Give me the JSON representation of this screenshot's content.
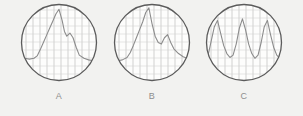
{
  "figure": {
    "background_color": "#f2f2f0",
    "panel_count": 3,
    "panels": [
      {
        "id": "A",
        "caption": "A",
        "shape": "circle",
        "border_color": "#5b5b5b",
        "grid_color": "#b9b9b9",
        "trace_color": "#8c8c8c",
        "description": "single tall narrow peak with small shoulder on falling edge",
        "peak_count": 1
      },
      {
        "id": "B",
        "caption": "B",
        "shape": "circle",
        "border_color": "#5b5b5b",
        "grid_color": "#b9b9b9",
        "trace_color": "#8c8c8c",
        "description": "one tall primary peak followed by one lower secondary peak",
        "peak_count": 2
      },
      {
        "id": "C",
        "caption": "C",
        "shape": "circle",
        "border_color": "#5b5b5b",
        "grid_color": "#b9b9b9",
        "trace_color": "#8c8c8c",
        "description": "three repeating peaks of similar height with deep valleys between",
        "peak_count": 3
      }
    ]
  },
  "chart_data": [
    {
      "type": "line",
      "title": "A",
      "xlabel": "",
      "ylabel": "",
      "grid": true,
      "xlim": [
        0,
        100
      ],
      "ylim": [
        0,
        100
      ],
      "legend": "none",
      "x": [
        0,
        6,
        12,
        18,
        22,
        26,
        30,
        34,
        38,
        42,
        46,
        50,
        54,
        57,
        60,
        64,
        68,
        72,
        76,
        82,
        88,
        94,
        100
      ],
      "values": [
        30,
        30,
        29,
        30,
        33,
        41,
        50,
        59,
        68,
        77,
        86,
        92,
        78,
        64,
        58,
        62,
        56,
        44,
        34,
        30,
        28,
        27,
        26
      ]
    },
    {
      "type": "line",
      "title": "B",
      "xlabel": "",
      "ylabel": "",
      "grid": true,
      "xlim": [
        0,
        100
      ],
      "ylim": [
        0,
        100
      ],
      "legend": "none",
      "x": [
        0,
        6,
        12,
        18,
        22,
        26,
        30,
        34,
        38,
        42,
        46,
        50,
        54,
        58,
        62,
        66,
        70,
        74,
        78,
        84,
        90,
        95,
        100
      ],
      "values": [
        26,
        27,
        28,
        31,
        37,
        46,
        56,
        66,
        76,
        88,
        94,
        74,
        58,
        50,
        48,
        56,
        60,
        50,
        42,
        36,
        32,
        30,
        29
      ]
    },
    {
      "type": "line",
      "title": "C",
      "xlabel": "",
      "ylabel": "",
      "grid": true,
      "xlim": [
        0,
        100
      ],
      "ylim": [
        0,
        100
      ],
      "legend": "none",
      "x": [
        0,
        4,
        8,
        12,
        16,
        20,
        24,
        28,
        32,
        36,
        40,
        44,
        48,
        52,
        56,
        60,
        64,
        68,
        72,
        76,
        80,
        84,
        88,
        92,
        96,
        100
      ],
      "values": [
        20,
        34,
        52,
        70,
        78,
        62,
        46,
        36,
        31,
        34,
        48,
        68,
        80,
        66,
        48,
        36,
        30,
        34,
        50,
        70,
        78,
        60,
        44,
        34,
        30,
        28
      ]
    }
  ]
}
